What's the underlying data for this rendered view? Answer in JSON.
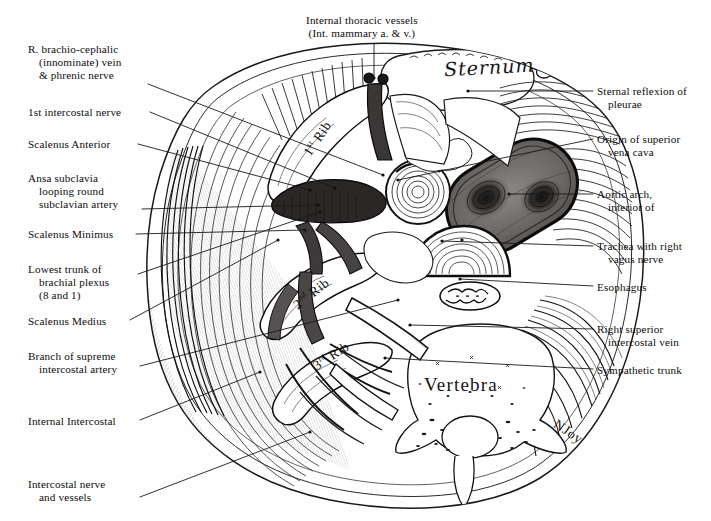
{
  "figure": {
    "signature": "NJoy",
    "background_color": "#fefefe",
    "ink_color": "#111111"
  },
  "structure_labels": {
    "sternum": "Sternum",
    "vertebra": "Vertebra",
    "ribs": [
      {
        "name": "first-rib",
        "ordinal": "1",
        "suffix": "st",
        "word": "Rib",
        "rotation": -56
      },
      {
        "name": "second-rib",
        "ordinal": "2",
        "suffix": "nd",
        "word": "Rib",
        "rotation": -38
      },
      {
        "name": "third-rib",
        "ordinal": "3",
        "suffix": "rd",
        "word": "Rib",
        "rotation": -33
      }
    ]
  },
  "labels_left": [
    {
      "name": "r-brachiocephalic-vein-phrenic-nerve",
      "lines": [
        "R. brachio-cephalic",
        "(innominate) vein",
        "& phrenic nerve"
      ],
      "x": 28,
      "y": 43,
      "leader": {
        "x1": 148,
        "y1": 84,
        "x2": 383,
        "y2": 175
      }
    },
    {
      "name": "first-intercostal-nerve",
      "lines": [
        "1st intercostal nerve"
      ],
      "x": 28,
      "y": 106,
      "leader": {
        "x1": 150,
        "y1": 112,
        "x2": 335,
        "y2": 188
      }
    },
    {
      "name": "scalenus-anterior",
      "lines": [
        "Scalenus Anterior"
      ],
      "x": 28,
      "y": 138,
      "leader": {
        "x1": 138,
        "y1": 144,
        "x2": 310,
        "y2": 190
      }
    },
    {
      "name": "ansa-subclavia",
      "lines": [
        "Ansa subclavia",
        "looping round",
        "subclavian artery"
      ],
      "x": 28,
      "y": 172,
      "leader": {
        "x1": 142,
        "y1": 209,
        "x2": 318,
        "y2": 205
      }
    },
    {
      "name": "scalenus-minimus",
      "lines": [
        "Scalenus Minimus"
      ],
      "x": 28,
      "y": 228,
      "leader": {
        "x1": 136,
        "y1": 234,
        "x2": 305,
        "y2": 230
      }
    },
    {
      "name": "lowest-trunk-brachial-plexus",
      "lines": [
        "Lowest trunk of",
        "brachial plexus",
        "(8 and 1)"
      ],
      "x": 28,
      "y": 263,
      "leader": {
        "x1": 138,
        "y1": 274,
        "x2": 320,
        "y2": 212
      }
    },
    {
      "name": "scalenus-medius",
      "lines": [
        "Scalenus Medius"
      ],
      "x": 28,
      "y": 315,
      "leader": {
        "x1": 130,
        "y1": 320,
        "x2": 278,
        "y2": 240
      }
    },
    {
      "name": "branch-supreme-intercostal-artery",
      "lines": [
        "Branch of supreme",
        "intercostal artery"
      ],
      "x": 28,
      "y": 350,
      "leader": {
        "x1": 140,
        "y1": 366,
        "x2": 398,
        "y2": 300
      }
    },
    {
      "name": "internal-intercostal",
      "lines": [
        "Internal Intercostal"
      ],
      "x": 28,
      "y": 415,
      "leader": {
        "x1": 140,
        "y1": 420,
        "x2": 260,
        "y2": 372
      }
    },
    {
      "name": "intercostal-nerve-and-vessels",
      "lines": [
        "Intercostal nerve",
        "and vessels"
      ],
      "x": 28,
      "y": 478,
      "leader": {
        "x1": 140,
        "y1": 497,
        "x2": 310,
        "y2": 432
      }
    }
  ],
  "labels_right": [
    {
      "name": "sternal-reflexion-of-pleurae",
      "lines": [
        "Sternal reflexion of",
        "pleurae"
      ],
      "x": 597,
      "y": 85,
      "leader": {
        "x1": 593,
        "y1": 91,
        "x2": 468,
        "y2": 91
      }
    },
    {
      "name": "origin-of-superior-vena-cava",
      "lines": [
        "Origin of superior",
        "vena cava"
      ],
      "x": 597,
      "y": 133,
      "leader": {
        "x1": 593,
        "y1": 139,
        "x2": 398,
        "y2": 180
      }
    },
    {
      "name": "aortic-arch-interior",
      "lines": [
        "Aortic arch,",
        "interior of"
      ],
      "x": 597,
      "y": 188,
      "leader": {
        "x1": 593,
        "y1": 194,
        "x2": 509,
        "y2": 194
      }
    },
    {
      "name": "trachea-with-right-vagus-nerve",
      "lines": [
        "Trachea with right",
        "vagus nerve"
      ],
      "x": 597,
      "y": 240,
      "leader": {
        "x1": 593,
        "y1": 246,
        "x2": 442,
        "y2": 241
      }
    },
    {
      "name": "esophagus",
      "lines": [
        "Esophagus"
      ],
      "x": 597,
      "y": 281,
      "leader": {
        "x1": 593,
        "y1": 286,
        "x2": 460,
        "y2": 279
      }
    },
    {
      "name": "right-superior-intercostal-vein",
      "lines": [
        "Right superior",
        "intercostal vein"
      ],
      "x": 597,
      "y": 323,
      "leader": {
        "x1": 593,
        "y1": 329,
        "x2": 410,
        "y2": 325
      }
    },
    {
      "name": "sympathetic-trunk",
      "lines": [
        "Sympathetic trunk"
      ],
      "x": 597,
      "y": 364,
      "leader": {
        "x1": 593,
        "y1": 369,
        "x2": 385,
        "y2": 358
      }
    }
  ],
  "labels_top": [
    {
      "name": "internal-thoracic-vessels",
      "lines": [
        "Internal thoracic vessels",
        "(Int. mammary a. & v.)"
      ],
      "x": 306,
      "y": 14,
      "leader": {
        "x1": 374,
        "y1": 44,
        "x2": 374,
        "y2": 78
      }
    }
  ],
  "colors": {
    "vein_dark": "#2c2c2c",
    "aorta_fill": "#6e6a68",
    "bone_fill": "#f5f4f2",
    "muscle_fill": "#e8e6e3",
    "leader_line": "#1a1a1a"
  }
}
